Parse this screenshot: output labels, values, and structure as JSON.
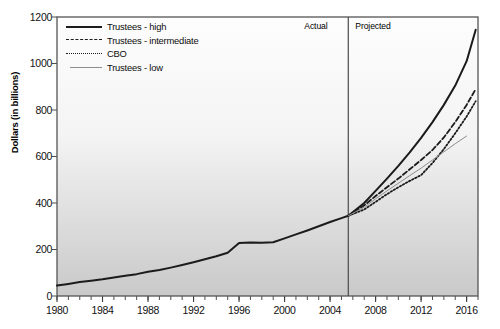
{
  "chart_data": {
    "type": "line",
    "title": "",
    "xlabel": "",
    "ylabel": "Dollars (in billions)",
    "xlim": [
      1980,
      2017
    ],
    "ylim": [
      0,
      1200
    ],
    "grid": false,
    "legend_position": "top-left",
    "y_ticks": [
      0,
      200,
      400,
      600,
      800,
      1000,
      1200
    ],
    "y_tick_labels": [
      "0",
      "200",
      "400",
      "600",
      "800",
      "1000",
      "1200"
    ],
    "x_ticks": [
      1980,
      1984,
      1988,
      1992,
      1996,
      2000,
      2004,
      2008,
      2012,
      2016
    ],
    "x_tick_labels": [
      "1980",
      "1984",
      "1988",
      "1992",
      "1996",
      "2000",
      "2004",
      "2008",
      "2012",
      "2016"
    ],
    "x_minor_tick_step": 1,
    "divider": {
      "x": 2005.6,
      "left_label": "Actual",
      "right_label": "Projected"
    },
    "series": [
      {
        "name": "Trustees - high",
        "style": "solid-thick",
        "color": "#1b1b1b",
        "x": [
          1980,
          1981,
          1982,
          1983,
          1984,
          1985,
          1986,
          1987,
          1988,
          1989,
          1990,
          1991,
          1992,
          1993,
          1994,
          1995,
          1996,
          1997,
          1998,
          1999,
          2000,
          2001,
          2002,
          2003,
          2004,
          2005,
          2005.6,
          2007,
          2008,
          2009,
          2010,
          2011,
          2012,
          2013,
          2014,
          2015,
          2016,
          2016.8
        ],
        "values": [
          45,
          52,
          60,
          66,
          72,
          80,
          87,
          94,
          104,
          112,
          122,
          133,
          145,
          158,
          171,
          186,
          228,
          230,
          229,
          231,
          248,
          265,
          282,
          300,
          318,
          335,
          345,
          400,
          452,
          505,
          560,
          618,
          680,
          748,
          822,
          905,
          1010,
          1145
        ]
      },
      {
        "name": "Trustees - intermediate",
        "style": "dashed",
        "color": "#1b1b1b",
        "x": [
          2005.6,
          2007,
          2008,
          2009,
          2010,
          2011,
          2012,
          2013,
          2014,
          2015,
          2016,
          2016.8
        ],
        "values": [
          345,
          390,
          430,
          468,
          505,
          545,
          585,
          628,
          682,
          748,
          822,
          890
        ]
      },
      {
        "name": "CBO",
        "style": "dotted",
        "color": "#1b1b1b",
        "x": [
          2005.6,
          2007,
          2008,
          2009,
          2010,
          2011,
          2012,
          2013,
          2014,
          2015,
          2016,
          2016.8
        ],
        "values": [
          345,
          372,
          405,
          438,
          468,
          495,
          520,
          572,
          632,
          700,
          772,
          838
        ]
      },
      {
        "name": "Trustees - low",
        "style": "solid-thin",
        "color": "#8d8d8d",
        "x": [
          2005.6,
          2007,
          2008,
          2009,
          2010,
          2011,
          2012,
          2013,
          2014,
          2015,
          2016
        ],
        "values": [
          345,
          382,
          418,
          452,
          485,
          518,
          550,
          585,
          620,
          655,
          688
        ]
      }
    ]
  }
}
